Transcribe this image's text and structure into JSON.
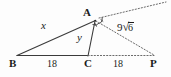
{
  "figure": {
    "type": "geometry-diagram",
    "background_color": "#fdfdfd",
    "stroke_color": "#3b3b3b",
    "text_color": "#1b1b1b",
    "vertices": [
      {
        "name": "B",
        "label": "B",
        "x": 17,
        "y": 55
      },
      {
        "name": "A",
        "label": "A",
        "x": 95,
        "y": 20
      },
      {
        "name": "C",
        "label": "C",
        "x": 88,
        "y": 55
      },
      {
        "name": "P",
        "label": "P",
        "x": 155,
        "y": 55
      }
    ],
    "vertex_labels": [
      {
        "key": "B",
        "text": "B",
        "x": 9,
        "y": 59
      },
      {
        "key": "A",
        "text": "A",
        "x": 83,
        "y": 8
      },
      {
        "key": "C",
        "text": "C",
        "x": 84,
        "y": 59
      },
      {
        "key": "P",
        "text": "P",
        "x": 150,
        "y": 59
      }
    ],
    "segments": [
      {
        "name": "segment-BA",
        "from": "B",
        "to": "A",
        "style": "solid"
      },
      {
        "name": "segment-BC-CP",
        "from": "B",
        "to": "C",
        "style": "solid"
      },
      {
        "name": "segment-AC",
        "from": "A",
        "to": "C",
        "style": "solid"
      },
      {
        "name": "segment-AP",
        "from": "A",
        "to": "P",
        "style": "dotted"
      },
      {
        "name": "segment-CP",
        "from": "C",
        "to": "P",
        "style": "dotted"
      },
      {
        "name": "ray-A-external",
        "from": "A",
        "to": "extension",
        "style": "dotted"
      }
    ],
    "side_labels": [
      {
        "name": "side-BA-label",
        "text": "x",
        "kind": "variable",
        "x": 41,
        "y": 21
      },
      {
        "name": "side-AC-label",
        "text": "y",
        "kind": "variable",
        "x": 77,
        "y": 33
      },
      {
        "name": "side-BC-label",
        "text": "18",
        "kind": "length",
        "x": 48,
        "y": 59
      },
      {
        "name": "side-CP-label",
        "text": "18",
        "kind": "length",
        "x": 114,
        "y": 59
      }
    ],
    "hypotenuse_label": {
      "name": "side-AP-label",
      "radical_sign": "√",
      "coefficient": "9",
      "radicand": "6",
      "full_text": "9√6",
      "x": 118,
      "y": 25
    },
    "angle_marks": {
      "name": "angle-bisector-marks-at-A",
      "count": 2,
      "tick_marks": 2,
      "at_vertex": "A",
      "meaning": "equal angles"
    }
  }
}
